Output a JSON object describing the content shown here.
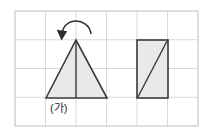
{
  "figure": {
    "grid": {
      "x0": 15,
      "y0": 11,
      "x1": 198,
      "y1": 126,
      "columns": 6,
      "rows": 4,
      "cell_width": 30.5,
      "cell_height": 28.75,
      "line_color": "#d9d9d9",
      "border_color": "#cfcfcf"
    },
    "shapes": [
      {
        "name": "triangle",
        "type": "polygon",
        "label": "(가)",
        "label_x": 50,
        "label_y": 111,
        "points": "46,98 76,40 107,98",
        "fill": "#e9e9e9",
        "stroke": "#3a3a3a",
        "inner_line": "76,40 76,98"
      },
      {
        "name": "rectangle",
        "type": "rect",
        "x": 137,
        "y": 40,
        "width": 31,
        "height": 58,
        "fill": "#e9e9e9",
        "stroke": "#3a3a3a",
        "inner_line": "137,98 168,40"
      }
    ],
    "arrow": {
      "name": "rotation-arrow",
      "arc_path": "M 91 34 A 15 12 0 1 0 62 33",
      "head_points": "62,40 57,30 67,31",
      "color": "#2d2d2d",
      "direction": "counter-clockwise"
    }
  }
}
